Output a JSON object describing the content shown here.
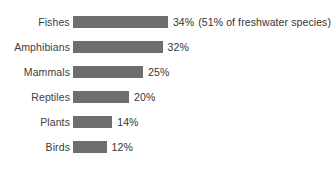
{
  "chart_data": {
    "type": "bar",
    "orientation": "horizontal",
    "title": "",
    "subtitle": "",
    "xlabel": "",
    "ylabel": "",
    "grid": false,
    "legend": null,
    "axis_lines": false,
    "xlim": [
      0,
      34
    ],
    "categories": [
      "Fishes",
      "Amphibians",
      "Mammals",
      "Reptiles",
      "Plants",
      "Birds"
    ],
    "values": [
      34,
      32,
      25,
      20,
      14,
      12
    ],
    "value_labels": [
      "34%",
      "32%",
      "25%",
      "20%",
      "14%",
      "12%"
    ],
    "annotations": [
      "(51% of freshwater species)",
      "",
      "",
      "",
      "",
      ""
    ],
    "bar_color": "#6e6e6e",
    "background_color": "#ffffff",
    "text_color": "#3a3a3a"
  },
  "rows": [
    {
      "label": "Fishes",
      "value": 34,
      "value_label": "34%",
      "annotation": "(51% of freshwater species)"
    },
    {
      "label": "Amphibians",
      "value": 32,
      "value_label": "32%",
      "annotation": ""
    },
    {
      "label": "Mammals",
      "value": 25,
      "value_label": "25%",
      "annotation": ""
    },
    {
      "label": "Reptiles",
      "value": 20,
      "value_label": "20%",
      "annotation": ""
    },
    {
      "label": "Plants",
      "value": 14,
      "value_label": "14%",
      "annotation": ""
    },
    {
      "label": "Birds",
      "value": 12,
      "value_label": "12%",
      "annotation": ""
    }
  ],
  "layout": {
    "row_height": 25,
    "first_row_center": 22,
    "bar_height": 12,
    "px_per_percent": 2.8
  }
}
